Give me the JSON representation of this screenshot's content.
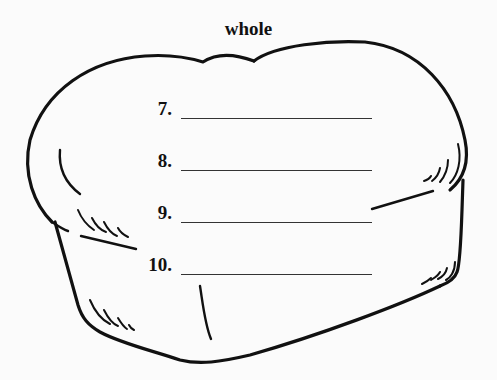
{
  "worksheet": {
    "title": "whole",
    "illustration": "bread-loaf-outline",
    "items": [
      {
        "number": "7.",
        "answer": ""
      },
      {
        "number": "8.",
        "answer": ""
      },
      {
        "number": "9.",
        "answer": ""
      },
      {
        "number": "10.",
        "answer": ""
      }
    ],
    "colors": {
      "ink": "#111111",
      "background": "#fbfbfb"
    }
  }
}
